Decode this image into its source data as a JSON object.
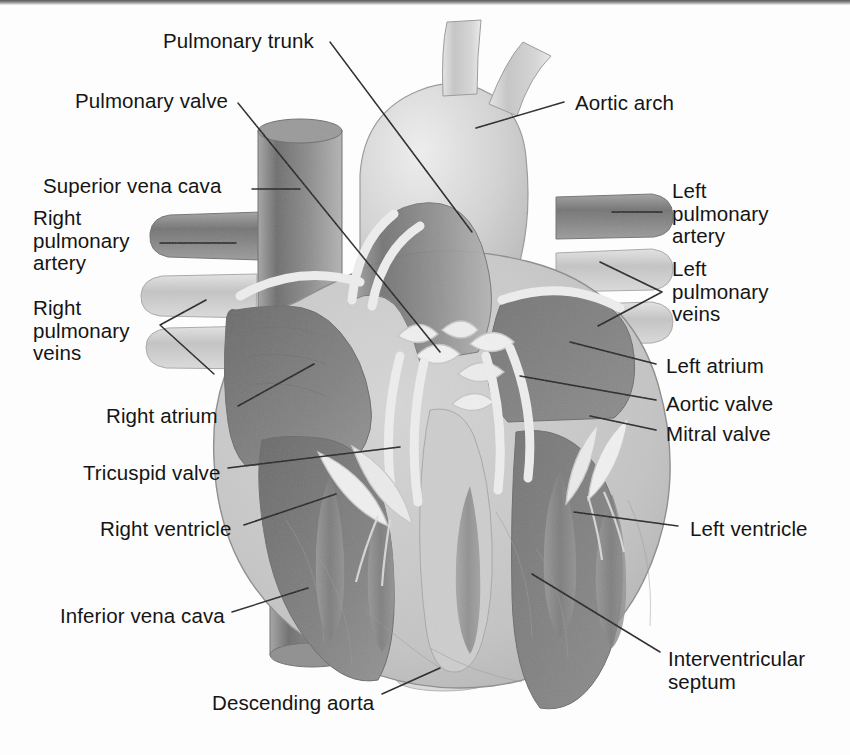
{
  "figure": {
    "style": "grayscale medical illustration",
    "background_color": "#fdfdfd",
    "text_color": "#151515",
    "leader_line_color": "#1a1a1a"
  },
  "palette": {
    "myocardium_light": "#c9c9c9",
    "chamber_dark": "#7b7b7b",
    "chamber_mid": "#9a9a9a",
    "vessel_dark": "#8c8c8c",
    "vessel_light": "#d2d2d2",
    "aorta_light": "#d8d8d8",
    "valve_white": "#efefef",
    "outline": "#6e6e6e"
  },
  "labels": [
    {
      "id": "pulmonary-trunk",
      "text": "Pulmonary trunk",
      "lines": [
        "Pulmonary trunk"
      ],
      "x": 163,
      "y": 30,
      "align": "left"
    },
    {
      "id": "pulmonary-valve",
      "text": "Pulmonary valve",
      "lines": [
        "Pulmonary valve"
      ],
      "x": 75,
      "y": 90,
      "align": "left"
    },
    {
      "id": "superior-vena-cava",
      "text": "Superior vena cava",
      "lines": [
        "Superior vena cava"
      ],
      "x": 43,
      "y": 175,
      "align": "left"
    },
    {
      "id": "right-pulmonary-artery",
      "text": "Right pulmonary artery",
      "lines": [
        "Right",
        "pulmonary",
        "artery"
      ],
      "x": 33,
      "y": 207,
      "align": "left"
    },
    {
      "id": "right-pulmonary-veins",
      "text": "Right pulmonary veins",
      "lines": [
        "Right",
        "pulmonary",
        "veins"
      ],
      "x": 33,
      "y": 297,
      "align": "left"
    },
    {
      "id": "right-atrium",
      "text": "Right atrium",
      "lines": [
        "Right atrium"
      ],
      "x": 106,
      "y": 405,
      "align": "left"
    },
    {
      "id": "tricuspid-valve",
      "text": "Tricuspid valve",
      "lines": [
        "Tricuspid valve"
      ],
      "x": 83,
      "y": 462,
      "align": "left"
    },
    {
      "id": "right-ventricle",
      "text": "Right ventricle",
      "lines": [
        "Right ventricle"
      ],
      "x": 100,
      "y": 518,
      "align": "left"
    },
    {
      "id": "inferior-vena-cava",
      "text": "Inferior vena cava",
      "lines": [
        "Inferior vena cava"
      ],
      "x": 60,
      "y": 605,
      "align": "left"
    },
    {
      "id": "descending-aorta",
      "text": "Descending aorta",
      "lines": [
        "Descending aorta"
      ],
      "x": 212,
      "y": 692,
      "align": "left"
    },
    {
      "id": "aortic-arch",
      "text": "Aortic arch",
      "lines": [
        "Aortic arch"
      ],
      "x": 575,
      "y": 92,
      "align": "left"
    },
    {
      "id": "left-pulmonary-artery",
      "text": "Left pulmonary artery",
      "lines": [
        "Left",
        "pulmonary",
        "artery"
      ],
      "x": 672,
      "y": 180,
      "align": "left"
    },
    {
      "id": "left-pulmonary-veins",
      "text": "Left pulmonary veins",
      "lines": [
        "Left",
        "pulmonary",
        "veins"
      ],
      "x": 672,
      "y": 258,
      "align": "left"
    },
    {
      "id": "left-atrium",
      "text": "Left atrium",
      "lines": [
        "Left atrium"
      ],
      "x": 666,
      "y": 355,
      "align": "left"
    },
    {
      "id": "aortic-valve",
      "text": "Aortic valve",
      "lines": [
        "Aortic valve"
      ],
      "x": 666,
      "y": 393,
      "align": "left"
    },
    {
      "id": "mitral-valve",
      "text": "Mitral valve",
      "lines": [
        "Mitral valve"
      ],
      "x": 666,
      "y": 423,
      "align": "left"
    },
    {
      "id": "left-ventricle",
      "text": "Left ventricle",
      "lines": [
        "Left ventricle"
      ],
      "x": 690,
      "y": 518,
      "align": "left"
    },
    {
      "id": "interventricular-septum",
      "text": "Interventricular septum",
      "lines": [
        "Interventricular",
        "septum"
      ],
      "x": 668,
      "y": 648,
      "align": "left"
    }
  ],
  "structures": [
    {
      "id": "superior-vena-cava",
      "name": "Superior vena cava",
      "tone": "vessel_dark"
    },
    {
      "id": "inferior-vena-cava",
      "name": "Inferior vena cava",
      "tone": "vessel_dark"
    },
    {
      "id": "pulmonary-trunk",
      "name": "Pulmonary trunk",
      "tone": "vessel_dark"
    },
    {
      "id": "aortic-arch",
      "name": "Aortic arch",
      "tone": "aorta_light"
    },
    {
      "id": "descending-aorta",
      "name": "Descending aorta",
      "tone": "vessel_light"
    },
    {
      "id": "right-pulmonary-artery",
      "name": "Right pulmonary artery",
      "tone": "vessel_dark"
    },
    {
      "id": "right-pulmonary-veins",
      "name": "Right pulmonary veins",
      "tone": "vessel_light"
    },
    {
      "id": "left-pulmonary-artery",
      "name": "Left pulmonary artery",
      "tone": "vessel_dark"
    },
    {
      "id": "left-pulmonary-veins",
      "name": "Left pulmonary veins",
      "tone": "vessel_light"
    },
    {
      "id": "right-atrium",
      "name": "Right atrium",
      "tone": "chamber_dark"
    },
    {
      "id": "left-atrium",
      "name": "Left atrium",
      "tone": "chamber_dark"
    },
    {
      "id": "right-ventricle",
      "name": "Right ventricle",
      "tone": "chamber_dark"
    },
    {
      "id": "left-ventricle",
      "name": "Left ventricle",
      "tone": "chamber_dark"
    },
    {
      "id": "interventricular-septum",
      "name": "Interventricular septum",
      "tone": "myocardium_light"
    },
    {
      "id": "tricuspid-valve",
      "name": "Tricuspid valve",
      "tone": "valve_white"
    },
    {
      "id": "mitral-valve",
      "name": "Mitral valve",
      "tone": "valve_white"
    },
    {
      "id": "pulmonary-valve",
      "name": "Pulmonary valve",
      "tone": "valve_white"
    },
    {
      "id": "aortic-valve",
      "name": "Aortic valve",
      "tone": "valve_white"
    }
  ]
}
